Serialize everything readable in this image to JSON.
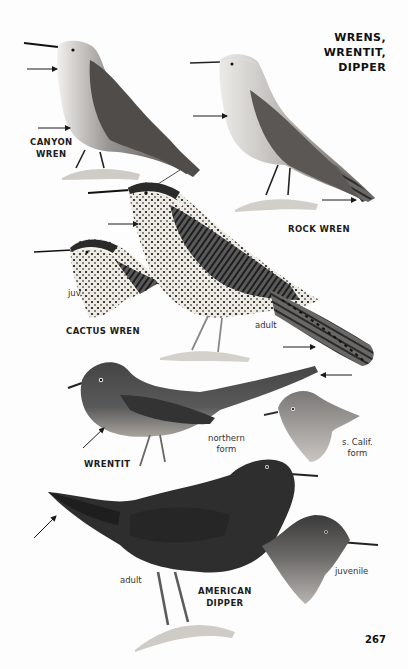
{
  "page": {
    "title_lines": [
      "WRENS,",
      "WRENTIT,",
      "DIPPER"
    ],
    "page_number": "267"
  },
  "species": [
    {
      "id": "canyon-wren",
      "label_lines": [
        "CANYON",
        "WREN"
      ]
    },
    {
      "id": "rock-wren",
      "label": "ROCK WREN"
    },
    {
      "id": "cactus-wren",
      "label": "CACTUS WREN",
      "annotations": [
        "juv.",
        "adult"
      ]
    },
    {
      "id": "wrentit",
      "label": "WRENTIT",
      "annotations": [
        [
          "northern",
          "form"
        ],
        [
          "s. Calif.",
          "form"
        ]
      ]
    },
    {
      "id": "american-dipper",
      "label_lines": [
        "AMERICAN",
        "DIPPER"
      ],
      "annotations": [
        "adult",
        "juvenile"
      ]
    }
  ],
  "colors": {
    "ink": "#1a1a1a",
    "canyon_body": "#5a5754",
    "rock_body": "#8a8784",
    "cactus_dark": "#2a2a2a",
    "wrentit_body": "#4e4e4e",
    "dipper_body": "#2f2f2f"
  }
}
